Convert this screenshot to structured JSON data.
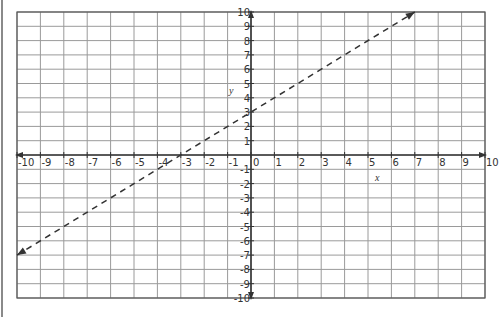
{
  "chart_data": {
    "type": "line",
    "title": "",
    "xlabel": "x",
    "ylabel": "y",
    "xlim": [
      -10,
      10
    ],
    "ylim": [
      -10,
      10
    ],
    "grid": true,
    "x_ticks": [
      -10,
      -9,
      -8,
      -7,
      -6,
      -5,
      -4,
      -3,
      -2,
      -1,
      0,
      1,
      2,
      3,
      4,
      5,
      6,
      7,
      8,
      9,
      10
    ],
    "y_ticks": [
      -10,
      -9,
      -8,
      -7,
      -6,
      -5,
      -4,
      -3,
      -2,
      -1,
      1,
      2,
      3,
      4,
      5,
      6,
      7,
      8,
      9,
      10
    ],
    "series": [
      {
        "name": "y = x + 3",
        "style": "dashed",
        "arrows": "both",
        "x": [
          -10,
          7
        ],
        "y": [
          -7,
          10
        ],
        "slope": 1,
        "intercept": 3,
        "x_intercept": -3
      }
    ],
    "legend": null
  },
  "colors": {
    "grid": "#9a9a9a",
    "axis": "#333333",
    "line": "#333333",
    "frame": "#555555"
  }
}
